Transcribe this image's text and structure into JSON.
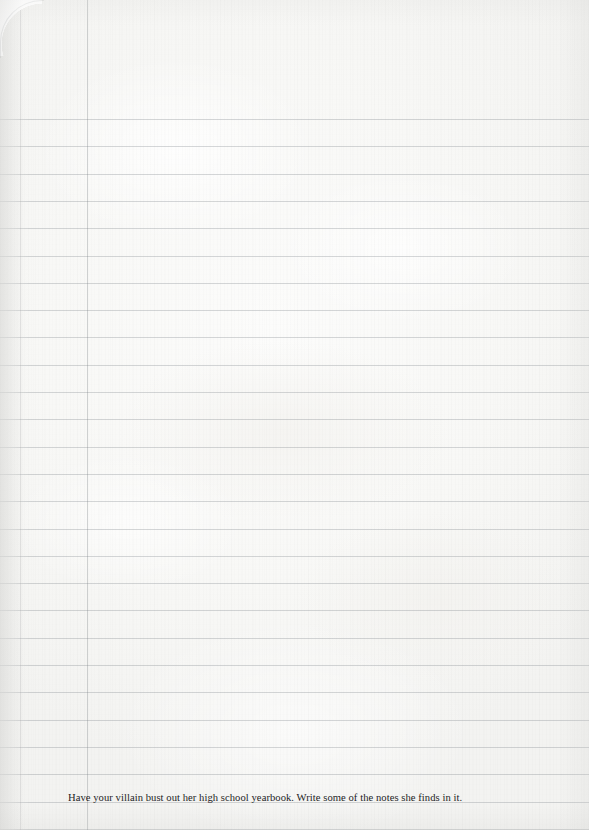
{
  "page": {
    "kind": "lined-notebook-page",
    "width": 589,
    "height": 830,
    "paper_color": "#f8f8f6",
    "rule_color": "#787e84",
    "margin_rule_color": "#787e84",
    "text_color": "#1d1d1f"
  },
  "prompt": {
    "text": "Have your villain bust out her high school yearbook. Write some of the notes she finds in it.",
    "left_px": 68,
    "baseline_y_px": 805
  },
  "ruling": {
    "first_line_y": 119,
    "spacing_px": 27.3,
    "line_count": 27,
    "margin_line_x": 87,
    "edge_line_x": 20
  }
}
